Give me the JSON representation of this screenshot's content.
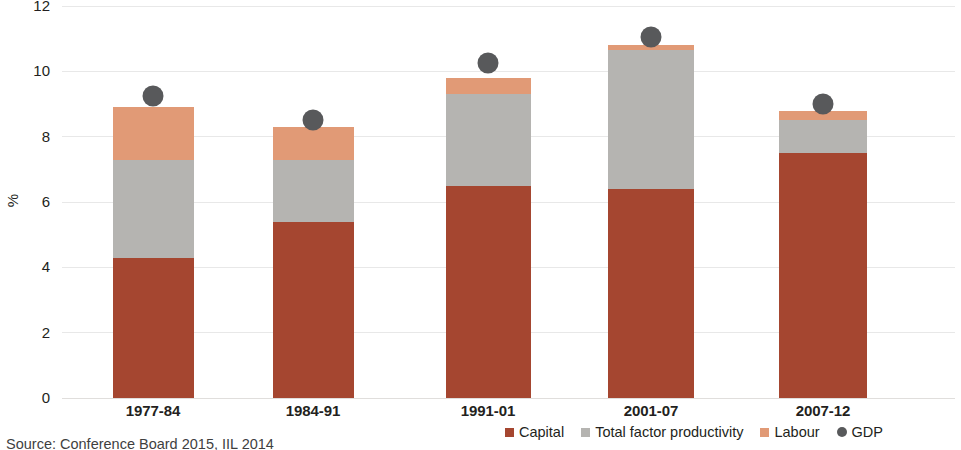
{
  "chart_data": {
    "type": "bar",
    "subtype": "stacked-bar-with-scatter-overlay",
    "title": "",
    "xlabel": "",
    "ylabel": "%",
    "ylim": [
      0,
      12
    ],
    "yticks": [
      0,
      2,
      4,
      6,
      8,
      10,
      12
    ],
    "ytick_labels": [
      "0",
      "2",
      "4",
      "6",
      "8",
      "10",
      "12"
    ],
    "grid": true,
    "grid_axis": "y",
    "legend_position": "bottom-right",
    "categories": [
      "1977-84",
      "1984-91",
      "1991-01",
      "2001-07",
      "2007-12"
    ],
    "series": [
      {
        "name": "Capital",
        "type": "bar",
        "color": "#a54630",
        "values": [
          4.3,
          5.4,
          6.5,
          6.4,
          7.5
        ]
      },
      {
        "name": "Total factor productivity",
        "type": "bar",
        "color": "#b5b4b1",
        "values": [
          3.0,
          1.9,
          2.8,
          4.25,
          1.0
        ]
      },
      {
        "name": "Labour",
        "type": "bar",
        "color": "#e19a76",
        "values": [
          1.6,
          1.0,
          0.5,
          0.15,
          0.3
        ]
      },
      {
        "name": "GDP",
        "type": "scatter",
        "color": "#58595b",
        "values": [
          9.25,
          8.5,
          10.25,
          11.05,
          9.0
        ]
      }
    ],
    "stack_totals": [
      8.9,
      8.3,
      9.8,
      10.8,
      8.8
    ],
    "source": "Source: Conference Board 2015, IIL 2014"
  },
  "axis": {
    "y_title": "%"
  },
  "legend": {
    "items": [
      {
        "label": "Capital",
        "color": "#a54630",
        "marker": "square"
      },
      {
        "label": "Total factor productivity",
        "color": "#b5b4b1",
        "marker": "square"
      },
      {
        "label": "Labour",
        "color": "#e19a76",
        "marker": "square"
      },
      {
        "label": "GDP",
        "color": "#58595b",
        "marker": "circle"
      }
    ]
  },
  "footer": {
    "source": "Source: Conference Board 2015, IIL 2014"
  }
}
